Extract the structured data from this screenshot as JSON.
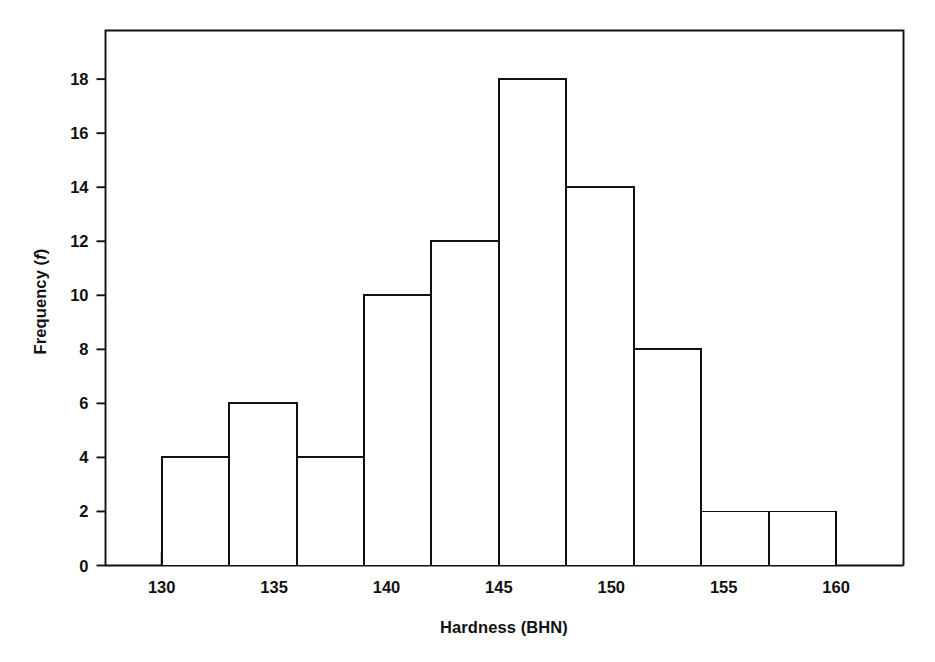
{
  "figure": {
    "background_color": "#ffffff",
    "line_color": "#111111",
    "bar_fill_color": "#ffffff"
  },
  "axis_titles": {
    "x": "Hardness (BHN)",
    "y_prefix": "Frequency (",
    "y_italic": "f",
    "y_suffix": ")"
  },
  "chart_data": {
    "type": "bar",
    "title": "",
    "subtitle": "",
    "xlabel": "Hardness (BHN)",
    "ylabel": "Frequency (f)",
    "orientation": "vertical",
    "grid": false,
    "legend": false,
    "legend_position": "none",
    "histogram": true,
    "bin_width": 3,
    "bin_edges": [
      130,
      133,
      136,
      139,
      142,
      145,
      148,
      151,
      154,
      157,
      160
    ],
    "categories": [
      "130-133",
      "133-136",
      "136-139",
      "139-142",
      "142-145",
      "145-148",
      "148-151",
      "151-154",
      "154-157",
      "157-160"
    ],
    "bin_midpoints": [
      131.5,
      134.5,
      137.5,
      140.5,
      143.5,
      146.5,
      149.5,
      152.5,
      155.5,
      158.5
    ],
    "values": [
      4,
      6,
      4,
      10,
      12,
      18,
      14,
      8,
      2,
      2
    ],
    "total_count": 80,
    "xlim": [
      127.5,
      163.0
    ],
    "ylim": [
      0,
      19.8
    ],
    "x_ticks": [
      130,
      135,
      140,
      145,
      150,
      155,
      160
    ],
    "x_tick_labels": [
      "130",
      "135",
      "140",
      "145",
      "150",
      "155",
      "160"
    ],
    "y_ticks": [
      0,
      2,
      4,
      6,
      8,
      10,
      12,
      14,
      16,
      18
    ],
    "y_tick_labels": [
      "0",
      "2",
      "4",
      "6",
      "8",
      "10",
      "12",
      "14",
      "16",
      "18"
    ],
    "annotations": []
  }
}
